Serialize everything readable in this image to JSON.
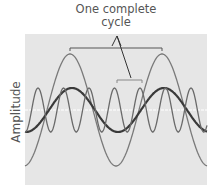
{
  "diagram": {
    "title_line1": "One complete",
    "title_line2": "cycle",
    "ylabel": "Amplitude",
    "background_color": "#e6e6e6",
    "midline_color": "#ffffff",
    "waves": [
      {
        "name": "large-low-frequency-wave",
        "color": "#7a7a7a",
        "amplitude": 56,
        "period": 92
      },
      {
        "name": "medium-low-frequency-wave",
        "color": "#3a3a3a",
        "amplitude": 22,
        "period": 92
      },
      {
        "name": "small-high-frequency-wave",
        "color": "#6a6a6a",
        "amplitude": 22,
        "period": 25.5
      }
    ]
  }
}
